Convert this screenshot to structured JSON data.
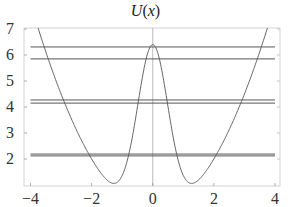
{
  "chart_data": {
    "type": "line",
    "title": "U(x)",
    "title_parts": {
      "func": "U",
      "open": "(",
      "var": "x",
      "close": ")"
    },
    "xlabel": "",
    "ylabel": "",
    "xlim": [
      -4,
      4
    ],
    "ylim": [
      0.96,
      7
    ],
    "x_ticks": [
      -4,
      -2,
      0,
      2,
      4
    ],
    "x_tick_labels": [
      "−4",
      "−2",
      "0",
      "2",
      "4"
    ],
    "y_ticks": [
      2,
      3,
      4,
      5,
      6,
      7
    ],
    "y_tick_labels": [
      "2",
      "3",
      "4",
      "5",
      "6",
      "7"
    ],
    "grid": false,
    "frame": true,
    "zero_axis_line": true,
    "series": [
      {
        "name": "U(x)",
        "kind": "curve",
        "description": "double-well potential, approx 0.5 x^2 + 6.4 exp(-2 x^2)",
        "x": [
          -4,
          -3.75,
          -3.5,
          -3,
          -2.5,
          -2,
          -1.6,
          -1.27,
          -1,
          -0.75,
          -0.5,
          -0.25,
          0,
          0.25,
          0.5,
          0.75,
          1,
          1.27,
          1.6,
          2,
          2.5,
          3,
          3.5,
          3.75,
          4
        ],
        "y": [
          8.0,
          7.03,
          6.13,
          4.5,
          3.13,
          2.0,
          1.3,
          1.06,
          1.37,
          2.39,
          4.01,
          5.68,
          6.4,
          5.68,
          4.01,
          2.39,
          1.37,
          1.06,
          1.3,
          2.0,
          3.13,
          4.5,
          6.13,
          7.03,
          8.0
        ],
        "color": "#555555"
      }
    ],
    "energy_levels": {
      "color": "#555555",
      "x_range": [
        -4,
        4
      ],
      "values": [
        2.12,
        2.19,
        4.15,
        4.27,
        5.85,
        6.31
      ]
    }
  }
}
